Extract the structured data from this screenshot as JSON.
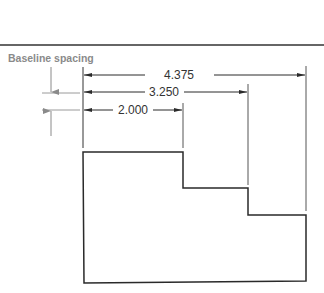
{
  "figure": {
    "caption": "Baseline spacing",
    "dimensions": [
      {
        "id": "dim-outer",
        "value": "4.375"
      },
      {
        "id": "dim-middle",
        "value": "3.250"
      },
      {
        "id": "dim-inner",
        "value": "2.000"
      }
    ],
    "colors": {
      "line": "#2a2a2a",
      "extension": "#555555",
      "spacing_marker": "#8a8a8a"
    }
  }
}
